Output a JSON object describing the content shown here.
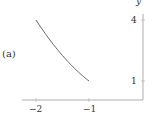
{
  "panel_label": "(a)",
  "chart_data": {
    "type": "line",
    "title": "",
    "xlabel": "",
    "ylabel": "y",
    "function": "y = x^2",
    "x_ticks": [
      "−2",
      "−1"
    ],
    "y_ticks": [
      "4",
      "1"
    ],
    "x": [
      -2,
      -1.75,
      -1.5,
      -1.25,
      -1
    ],
    "values": [
      4,
      3.0625,
      2.25,
      1.5625,
      1
    ],
    "xlim": [
      -2.25,
      0
    ],
    "ylim": [
      0,
      4.5
    ],
    "grid": false,
    "legend": null
  },
  "colors": {
    "axis": "#999999",
    "curve": "#555555",
    "text": "#333333"
  }
}
